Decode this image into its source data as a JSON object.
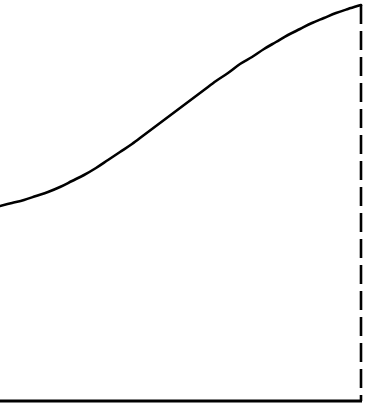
{
  "chart_data": {
    "type": "line",
    "title": "",
    "subtitle": "",
    "xlabel": "",
    "ylabel": "",
    "xlim": [
      0,
      379
    ],
    "ylim": [
      0,
      416
    ],
    "grid": false,
    "legend": null,
    "legend_position": "none",
    "tick_labels_x": [],
    "tick_labels_y": [],
    "annotations": [],
    "background_color": "#ffffff",
    "series": [
      {
        "name": "growth-curve",
        "shape": "sigmoid",
        "color": "#000000",
        "line_width": 2.6,
        "line_style": "solid",
        "x": [
          0,
          12,
          24,
          36,
          48,
          60,
          72,
          84,
          96,
          108,
          120,
          132,
          144,
          156,
          168,
          180,
          192,
          204,
          216,
          228,
          240,
          252,
          264,
          276,
          288,
          300,
          312,
          324,
          336,
          348,
          361
        ],
        "y": [
          206,
          203,
          200,
          196,
          192,
          187,
          181,
          175,
          168,
          160,
          152,
          144,
          135,
          126,
          117,
          108,
          99,
          90,
          81,
          73,
          64,
          57,
          49,
          42,
          35,
          29,
          23,
          18,
          13,
          9,
          5
        ]
      }
    ],
    "reference_lines": [
      {
        "name": "endpoint-drop-line",
        "orientation": "vertical",
        "x": 361,
        "y_start": 5,
        "y_end": 401,
        "style": "dashed",
        "color": "#000000",
        "line_width": 2.6,
        "dash_length": 19,
        "gap_length": 7
      }
    ],
    "axes": [
      {
        "name": "x-axis",
        "orientation": "horizontal",
        "y": 401,
        "x_start": 0,
        "x_end": 362,
        "style": "solid",
        "color": "#000000",
        "line_width": 3
      }
    ]
  }
}
